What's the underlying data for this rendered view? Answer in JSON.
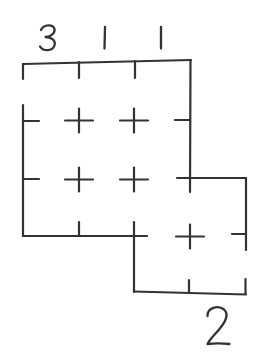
{
  "figure": {
    "background_color": "#ffffff",
    "stroke_color": "#333333",
    "stroke_width": 2.2,
    "digit_stroke_width": 2.3,
    "grid": {
      "columns_x": [
        23,
        79,
        135,
        190,
        246
      ],
      "rows_y": [
        61,
        120,
        178,
        236,
        293
      ]
    },
    "segments": [
      {
        "name": "top-edge",
        "x1": 23,
        "y1": 64,
        "x2": 191,
        "y2": 60
      },
      {
        "name": "top-left-corner-tick",
        "x1": 23,
        "y1": 64,
        "x2": 23,
        "y2": 79
      },
      {
        "name": "top-tick-col2",
        "x1": 79,
        "y1": 62,
        "x2": 79,
        "y2": 78
      },
      {
        "name": "top-tick-col3",
        "x1": 135,
        "y1": 61,
        "x2": 135,
        "y2": 78
      },
      {
        "name": "right-edge-upper",
        "x1": 190.5,
        "y1": 60,
        "x2": 190,
        "y2": 192
      },
      {
        "name": "right-inner-tick-row2",
        "x1": 175,
        "y1": 120,
        "x2": 190,
        "y2": 120
      },
      {
        "name": "left-edge",
        "x1": 23,
        "y1": 105,
        "x2": 23,
        "y2": 236
      },
      {
        "name": "left-inner-tick-row2",
        "x1": 23,
        "y1": 121,
        "x2": 39,
        "y2": 121
      },
      {
        "name": "left-inner-tick-row3",
        "x1": 23,
        "y1": 179,
        "x2": 39,
        "y2": 179
      },
      {
        "name": "step-edge-row3",
        "x1": 177,
        "y1": 178,
        "x2": 246,
        "y2": 178
      },
      {
        "name": "right-ext-edge-upper",
        "x1": 246,
        "y1": 178,
        "x2": 246,
        "y2": 250
      },
      {
        "name": "right-inner-tick-row4",
        "x1": 232,
        "y1": 234,
        "x2": 246,
        "y2": 234
      },
      {
        "name": "right-ext-edge-lower",
        "x1": 245.5,
        "y1": 279,
        "x2": 245.5,
        "y2": 294
      },
      {
        "name": "bottom-edge-left",
        "x1": 23,
        "y1": 236,
        "x2": 147,
        "y2": 236
      },
      {
        "name": "bottom-tick-col2",
        "x1": 79,
        "y1": 222,
        "x2": 79,
        "y2": 236
      },
      {
        "name": "step-edge-vertical",
        "x1": 134,
        "y1": 222,
        "x2": 134,
        "y2": 292
      },
      {
        "name": "bottom-edge-right",
        "x1": 134,
        "y1": 291.5,
        "x2": 246,
        "y2": 294.5
      },
      {
        "name": "bottom-tick-col3",
        "x1": 189,
        "y1": 280,
        "x2": 189,
        "y2": 292
      }
    ],
    "cross_arm": {
      "hx": 14,
      "vy": 12
    },
    "crosses": [
      {
        "x": 79,
        "y": 120.5
      },
      {
        "x": 134,
        "y": 120.5
      },
      {
        "x": 79,
        "y": 179.5
      },
      {
        "x": 134,
        "y": 179.5
      },
      {
        "x": 190,
        "y": 236.5
      }
    ]
  },
  "labels": [
    {
      "id": "top-col1",
      "text": "3",
      "x": 48,
      "y": 38,
      "d": "M 41 30 C 44 24 53 24 54.5 29 C 55.5 34 49 37 45.5 37 C 50.5 37 56 40 54.5 45.5 C 52.5 51.5 43 51.5 40 46.5"
    },
    {
      "id": "top-col2",
      "text": "1",
      "x": 105,
      "y": 38,
      "d": "M 105 27 L 104.5 48.5"
    },
    {
      "id": "top-col3",
      "text": "1",
      "x": 161,
      "y": 38,
      "d": "M 161 27 L 161 48.5"
    },
    {
      "id": "bottom-col4",
      "text": "2",
      "x": 218,
      "y": 326,
      "d": "M 207.5 316 C 207 308 218 304.5 224 309.5 C 229.5 314.5 224.5 323 219.5 329 C 214.5 335 210 339 207.5 344 C 214 343.2 222 343.2 229.5 344"
    }
  ]
}
